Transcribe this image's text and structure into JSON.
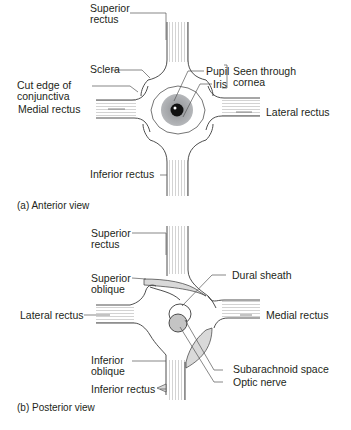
{
  "colors": {
    "stroke": "#3a3a3a",
    "leader": "#555555",
    "iris": "#a7a9ac",
    "pupil": "#111111",
    "muscle_hatch": "#c8c8c8",
    "sheath_fill": "#d9d9d9",
    "background": "#ffffff"
  },
  "anterior": {
    "caption": "(a) Anterior view",
    "labels": {
      "superior_rectus_1": "Superior",
      "superior_rectus_2": "rectus",
      "sclera": "Sclera",
      "cut_edge_1": "Cut edge of",
      "cut_edge_2": "conjunctiva",
      "medial_rectus": "Medial rectus",
      "pupil": "Pupil",
      "iris": "Iris",
      "seen_through_1": "Seen through",
      "seen_through_2": "cornea",
      "lateral_rectus": "Lateral rectus",
      "inferior_rectus": "Inferior rectus"
    }
  },
  "posterior": {
    "caption": "(b) Posterior view",
    "labels": {
      "superior_rectus_1": "Superior",
      "superior_rectus_2": "rectus",
      "superior_oblique_1": "Superior",
      "superior_oblique_2": "oblique",
      "dural_sheath": "Dural sheath",
      "lateral_rectus": "Lateral rectus",
      "medial_rectus": "Medial rectus",
      "subarachnoid_space": "Subarachnoid space",
      "optic_nerve": "Optic nerve",
      "inferior_oblique_1": "Inferior",
      "inferior_oblique_2": "oblique",
      "inferior_rectus": "Inferior rectus"
    }
  }
}
